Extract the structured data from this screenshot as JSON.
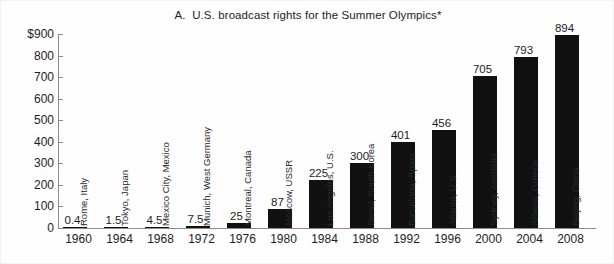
{
  "chart_data": {
    "type": "bar",
    "title": "A.  U.S. broadcast rights for the Summer Olympics*",
    "xlabel": "",
    "ylabel": "",
    "ylim": [
      0,
      900
    ],
    "grid": false,
    "legend": "none",
    "y_ticks": [
      "$900",
      "800",
      "700",
      "600",
      "500",
      "400",
      "300",
      "200",
      "100",
      "0"
    ],
    "y_tick_values": [
      900,
      800,
      700,
      600,
      500,
      400,
      300,
      200,
      100,
      0
    ],
    "categories": [
      "1960",
      "1964",
      "1968",
      "1972",
      "1976",
      "1980",
      "1984",
      "1988",
      "1992",
      "1996",
      "2000",
      "2004",
      "2008"
    ],
    "values": [
      0.4,
      1.5,
      4.5,
      7.5,
      25,
      87,
      225,
      300,
      401,
      456,
      705,
      793,
      894
    ],
    "value_labels": [
      "0.4",
      "1.5",
      "4.5",
      "7.5",
      "25",
      "87",
      "225",
      "300",
      "401",
      "456",
      "705",
      "793",
      "894"
    ],
    "annotations": [
      "Rome, Italy",
      "Tokyo, Japan",
      "Mexico City, Mexico",
      "Munich, West Germany",
      "Montreal, Canada",
      "Moscow, USSR",
      "Los Angeles, U.S.",
      "Seoul, South Korea",
      "Barcelona, Spain",
      "Atlanta, U.S.",
      "Sydney, Australia",
      "Athens, Greece",
      "Beijing, China"
    ],
    "bar_color": "#111111",
    "axis_color": "#8a8a8a",
    "background": "#fefefe",
    "units_note": "millions of U.S. dollars"
  }
}
